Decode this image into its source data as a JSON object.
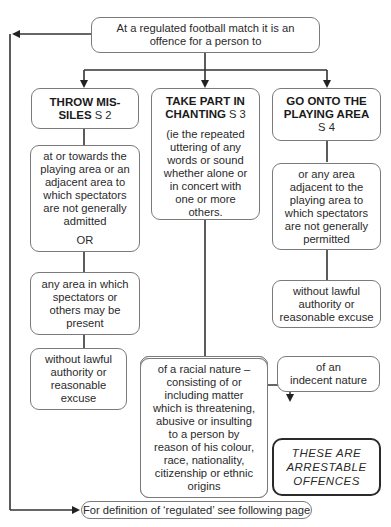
{
  "top_box": {
    "text_line1": "At a regulated football match it is an",
    "text_line2": "offence for a person to"
  },
  "columns": [
    {
      "title_line1": "THROW MIS-",
      "title_line2": "SILES",
      "section": "S 2",
      "boxes": [
        {
          "lines": [
            "at or towards the",
            "playing area or an",
            "adjacent area to",
            "which spectators",
            "are not generally",
            "admitted"
          ],
          "connector": "OR"
        },
        {
          "lines": [
            "any area in which",
            "spectators or",
            "others may be",
            "present"
          ]
        },
        {
          "lines": [
            "without lawful",
            "authority or",
            "reasonable",
            "excuse"
          ]
        }
      ]
    },
    {
      "title_line1": "TAKE PART IN",
      "title_line2": "CHANTING",
      "section": "S 3",
      "description": [
        "(ie the repeated",
        "uttering of any",
        "words or sound",
        "whether alone or",
        "in concert with",
        "one or more",
        "others."
      ],
      "sub_boxes": [
        {
          "lines": [
            "of a racial nature –",
            "consisting of or",
            "including matter",
            "which is threatening,",
            "abusive or insulting",
            "to a person by",
            "reason of his colour,",
            "race, nationality,",
            "citizenship or ethnic",
            "origins"
          ]
        },
        {
          "lines": [
            "of an",
            "indecent nature"
          ]
        }
      ]
    },
    {
      "title_line1": "GO ONTO THE",
      "title_line2": "PLAYING AREA",
      "section": "S 4",
      "boxes": [
        {
          "lines": [
            "or any area",
            "adjacent to the",
            "playing area to",
            "which spectators",
            "are not generally",
            "permitted"
          ]
        },
        {
          "lines": [
            "without lawful",
            "authority or",
            "reasonable excuse"
          ]
        }
      ]
    }
  ],
  "note_box": {
    "lines": [
      "THESE ARE",
      "ARRESTABLE",
      "OFFENCES"
    ]
  },
  "footer_box": {
    "text": "For definition of ‘regulated’ see following page"
  }
}
